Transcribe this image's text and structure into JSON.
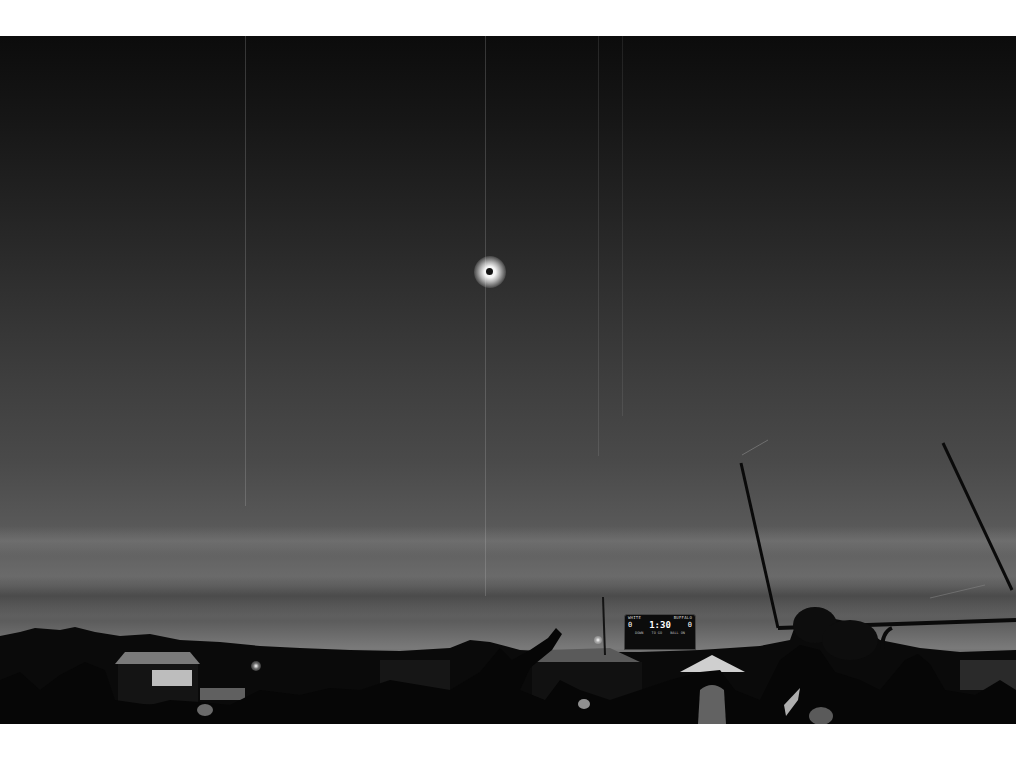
{
  "scene": {
    "description": "Black-and-white photograph of a total solar eclipse above a high school football field, crowd silhouetted below",
    "palette": {
      "sky_top": "#0c0c0c",
      "sky_mid": "#3e3e3e",
      "sky_horizon": "#7a7a7a",
      "ground": "#050505",
      "corona": "#ffffff"
    },
    "eclipse": {
      "label": "total-solar-eclipse",
      "x": 490,
      "y": 271
    },
    "goalpost": {
      "label": "football-goalpost",
      "left_upright": [
        741,
        463,
        778,
        627
      ],
      "right_upright": [
        943,
        443,
        1012,
        590
      ],
      "crossbar_y": 627
    },
    "scoreboard": {
      "home_team": "WHITE",
      "away_team": "BUFFALO",
      "clock": "1:30",
      "home_score": "0",
      "away_score": "0",
      "labels": [
        "DOWN",
        "TO GO",
        "BALL ON"
      ]
    },
    "elements": [
      "eclipse-corona",
      "football-goalpost",
      "scoreboard",
      "tent-canopy",
      "crowd-silhouettes",
      "raised-arm-pointing",
      "tree-line-horizon",
      "light-pole",
      "banner"
    ]
  }
}
